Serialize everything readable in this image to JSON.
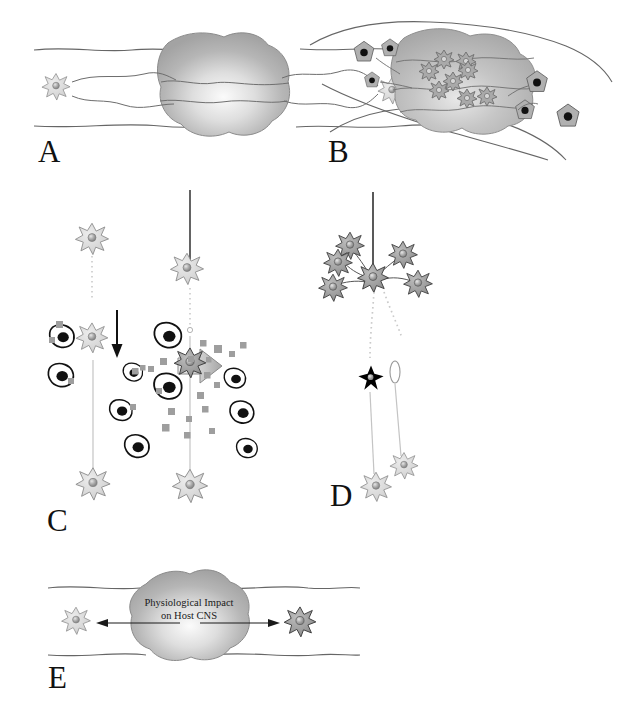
{
  "figure": {
    "width": 619,
    "height": 710,
    "background_color": "#ffffff",
    "panels": [
      {
        "id": "A",
        "label": "A",
        "name": "panel-a-intact-vessel-with-mass",
        "description": "Blood vessel with a smooth round mass and one astrocyte at each end contacting the vessel wall",
        "cell_counts": {
          "astrocytes_outside": 2,
          "infiltrating_cells": 0
        }
      },
      {
        "id": "B",
        "label": "B",
        "name": "panel-b-infiltrated-mass",
        "description": "Lobulated mass within curving vessel walls, infiltrated by pale intratumoural cells and surrounded by dark-nucleus cells",
        "cell_counts": {
          "cells_inside_mass": 8,
          "cells_outside_mass": 6
        }
      },
      {
        "id": "C",
        "label": "C",
        "name": "panel-c-activation-of-glia",
        "description": "Left: resting astrocyte surrounded by amoeboid dark-nucleus cells. Right: activated astrocyte releasing cytokine particles",
        "left_state": "resting",
        "right_state": "activated",
        "cytokine_particles_left": 5,
        "cytokine_particles_right": 19,
        "transition_arrow": "rightward-block-arrow",
        "down_arrow": "thin-down-arrow"
      },
      {
        "id": "D",
        "label": "D",
        "name": "panel-d-gliosis-and-degeneration",
        "description": "Cluster of reactive astrocytes around a central process-bearing cell, with a degenerating black cell below on the fibre tract",
        "reactive_astrocytes": 5,
        "degenerating_cell": 1,
        "distal_astrocytes": 2
      },
      {
        "id": "E",
        "label": "E",
        "name": "panel-e-physiological-impact",
        "description": "Mass in vessel with bidirectional arrows toward flanking astrocytes and an overlay caption",
        "caption_lines": [
          "Physiological Impact",
          "on Host CNS"
        ],
        "arrow_directions": [
          "left",
          "right"
        ]
      }
    ],
    "legend_semantics": {
      "astrocyte": "star-shaped pale grey cell with round nucleus",
      "reactive_astrocyte": "star-shaped mid-grey cell, darker outline",
      "degenerating_cell": "solid black star-shaped cell",
      "amoeboid_cell": "irregular white cell with large black nucleus",
      "cytokine_particle": "small grey square",
      "mass": "grey radial-gradient blob",
      "vessel_wall": "thin wavy black line"
    },
    "colors": {
      "ink": "#1a1a1a",
      "vessel_line": "#555555",
      "mass_light": "#f2f2f2",
      "mass_mid": "#b9b9b9",
      "mass_dark": "#9a9a9a",
      "astrocyte_fill": "#d9d9d9",
      "astrocyte_stroke": "#8d8d8d",
      "nucleus_fill": "#a6a6a6",
      "reactive_fill": "#9e9e9e",
      "reactive_stroke": "#4a4a4a",
      "dark_nucleus": "#111111",
      "cytokine": "#9e9e9e",
      "black_cell": "#000000",
      "dotted_process": "#c8c8c8"
    }
  }
}
